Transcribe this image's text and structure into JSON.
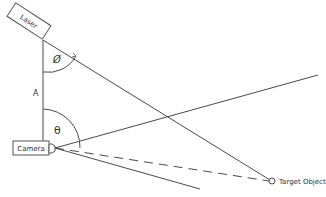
{
  "diagram": {
    "type": "laser triangulation geometry",
    "labels": {
      "laser": "Laser",
      "camera": "Camera",
      "target": "Target Object",
      "baseline": "A",
      "laser_angle": "Ø",
      "camera_angle": "θ"
    },
    "colors": {
      "line": "#4a4a4a",
      "box_stroke": "#555555",
      "background": "#ffffff"
    }
  }
}
